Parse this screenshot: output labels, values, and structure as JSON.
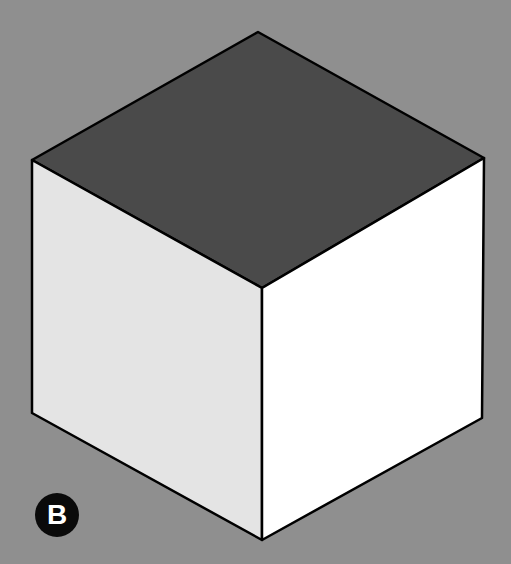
{
  "figure": {
    "background_color": "#8f8f8f",
    "cube": {
      "top_face_color": "#4a4a4a",
      "left_face_color": "#e4e4e4",
      "right_face_color": "#ffffff",
      "edge_color": "#000000",
      "vertices": {
        "top": [
          258,
          32
        ],
        "upper_left": [
          32,
          160
        ],
        "upper_right": [
          484,
          158
        ],
        "center": [
          262,
          288
        ],
        "lower_left": [
          32,
          413
        ],
        "lower_right": [
          482,
          418
        ],
        "bottom": [
          262,
          540
        ]
      }
    },
    "label": {
      "text": "B",
      "background_color": "#0a0a0a",
      "text_color": "#ffffff"
    }
  }
}
